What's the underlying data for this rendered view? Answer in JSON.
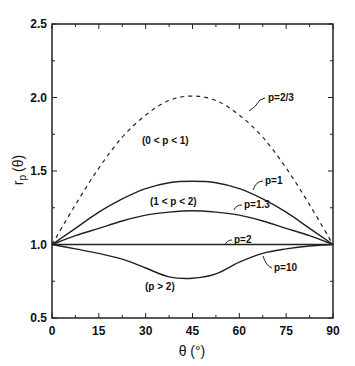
{
  "chart_data": {
    "type": "line",
    "title": "",
    "xlabel": "θ (°)",
    "ylabel": "r_p (θ)",
    "xlim": [
      0,
      90
    ],
    "ylim": [
      0.5,
      2.5
    ],
    "xticks": [
      0,
      15,
      30,
      45,
      60,
      75,
      90
    ],
    "yticks": [
      0.5,
      1.0,
      1.5,
      2.0,
      2.5
    ],
    "grid": false,
    "legend": "none (curves labeled inline)",
    "x": [
      0,
      7.5,
      15,
      22.5,
      30,
      37.5,
      45,
      52.5,
      60,
      67.5,
      75,
      82.5,
      90
    ],
    "series": [
      {
        "name": "p=2/3",
        "style": "dashed",
        "values": [
          1.0,
          1.27,
          1.52,
          1.73,
          1.88,
          1.98,
          2.01,
          1.98,
          1.88,
          1.73,
          1.52,
          1.27,
          1.0
        ]
      },
      {
        "name": "p=1",
        "style": "solid",
        "values": [
          1.0,
          1.11,
          1.22,
          1.31,
          1.38,
          1.42,
          1.43,
          1.42,
          1.38,
          1.31,
          1.22,
          1.11,
          1.0
        ]
      },
      {
        "name": "p=1.3",
        "style": "solid",
        "values": [
          1.0,
          1.06,
          1.11,
          1.16,
          1.2,
          1.22,
          1.23,
          1.22,
          1.2,
          1.16,
          1.11,
          1.06,
          1.0
        ]
      },
      {
        "name": "p=2",
        "style": "solid",
        "values": [
          1.0,
          1.0,
          1.0,
          1.0,
          1.0,
          1.0,
          1.0,
          1.0,
          1.0,
          1.0,
          1.0,
          1.0,
          1.0
        ]
      },
      {
        "name": "p=10",
        "style": "solid",
        "values": [
          1.0,
          0.97,
          0.94,
          0.9,
          0.84,
          0.78,
          0.77,
          0.8,
          0.88,
          0.94,
          0.97,
          0.99,
          1.0
        ]
      }
    ],
    "annotations": [
      "(0 < p < 1)",
      "(1 < p < 2)",
      "(p > 2)",
      "p=2/3",
      "p=1",
      "p=1.3",
      "p=2",
      "p=10"
    ]
  },
  "axes": {
    "xlabel": "θ (°)",
    "ylabel_main": "r",
    "ylabel_sub": "p",
    "ylabel_arg": "(θ)",
    "xtick_labels": [
      "0",
      "15",
      "30",
      "45",
      "60",
      "75",
      "90"
    ],
    "ytick_labels": [
      "0.5",
      "1.0",
      "1.5",
      "2.0",
      "2.5"
    ]
  },
  "labels": {
    "region_low": "(0 < p < 1)",
    "region_mid": "(1 < p < 2)",
    "region_high": "(p > 2)",
    "p_2_3": "p=2/3",
    "p_1": "p=1",
    "p_1_3": "p=1.3",
    "p_2": "p=2",
    "p_10": "p=10"
  }
}
